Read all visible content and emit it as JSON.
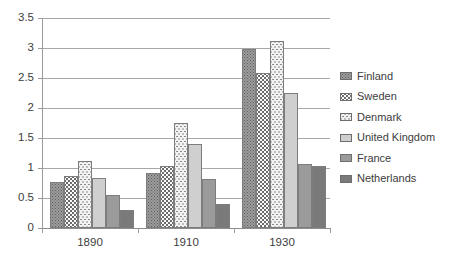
{
  "chart_data": {
    "type": "bar",
    "title": "",
    "subtitle": "",
    "xlabel": "",
    "ylabel": "",
    "categories": [
      "1890",
      "1910",
      "1930"
    ],
    "series": [
      {
        "name": "Finland",
        "values": [
          0.76,
          0.91,
          2.98
        ],
        "swatch": "pat-finland",
        "color": "#9d9d9d"
      },
      {
        "name": "Sweden",
        "values": [
          0.86,
          1.03,
          2.59
        ],
        "swatch": "pat-sweden",
        "color": "#fbfbfb"
      },
      {
        "name": "Denmark",
        "values": [
          1.11,
          1.75,
          3.12
        ],
        "swatch": "pat-denmark",
        "color": "#f2f2f2"
      },
      {
        "name": "United Kingdom",
        "values": [
          0.84,
          1.4,
          2.25
        ],
        "swatch": "pat-uk",
        "color": "#cfcfcf"
      },
      {
        "name": "France",
        "values": [
          0.55,
          0.82,
          1.06
        ],
        "swatch": "pat-france",
        "color": "#9b9b9b"
      },
      {
        "name": "Netherlands",
        "values": [
          0.3,
          0.4,
          1.04
        ],
        "swatch": "pat-nl",
        "color": "#7a7a7a"
      }
    ],
    "ylim": [
      0,
      3.5
    ],
    "ytick_step": 0.5,
    "yticks": [
      "3.5",
      "3",
      "2.5",
      "2",
      "1.5",
      "1",
      "0.5",
      "0"
    ],
    "ytick_values": [
      3.5,
      3,
      2.5,
      2,
      1.5,
      1,
      0.5,
      0
    ],
    "grid": true,
    "grid_axis": "y",
    "legend_position": "right",
    "bar_border_color": "#7d7d7d",
    "gridline_color": "#a8a8a8",
    "axis_color": "#9a9a9a",
    "background": "#ffffff",
    "text_color": "#3d3d3d"
  },
  "legend": {
    "items": [
      {
        "label": "Finland"
      },
      {
        "label": "Sweden"
      },
      {
        "label": "Denmark"
      },
      {
        "label": "United Kingdom"
      },
      {
        "label": "France"
      },
      {
        "label": "Netherlands"
      }
    ]
  }
}
